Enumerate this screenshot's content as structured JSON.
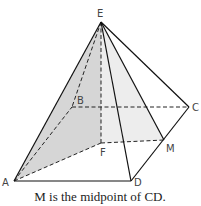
{
  "diagram": {
    "points": {
      "E": [
        101,
        22
      ],
      "A": [
        14,
        181
      ],
      "B": [
        72,
        107
      ],
      "C": [
        189,
        107
      ],
      "D": [
        131,
        181
      ],
      "F": [
        101,
        143
      ],
      "M": [
        164,
        140
      ]
    },
    "labels": {
      "E": "E",
      "A": "A",
      "B": "B",
      "C": "C",
      "D": "D",
      "F": "F",
      "M": "M"
    },
    "solid_edges": [
      [
        "E",
        "A"
      ],
      [
        "E",
        "C"
      ],
      [
        "E",
        "D"
      ],
      [
        "E",
        "M"
      ],
      [
        "A",
        "D"
      ],
      [
        "D",
        "C"
      ]
    ],
    "dashed_edges": [
      [
        "E",
        "B"
      ],
      [
        "E",
        "F"
      ],
      [
        "A",
        "B"
      ],
      [
        "B",
        "C"
      ],
      [
        "A",
        "F"
      ],
      [
        "F",
        "M"
      ]
    ],
    "shaded_regions": [
      {
        "name": "triangle-EAF",
        "points": [
          "E",
          "A",
          "F"
        ],
        "color": "#c8c8c8"
      },
      {
        "name": "triangle-EFM",
        "points": [
          "E",
          "F",
          "M"
        ],
        "color": "#ececec"
      }
    ],
    "caption": "M is the midpoint of CD."
  }
}
